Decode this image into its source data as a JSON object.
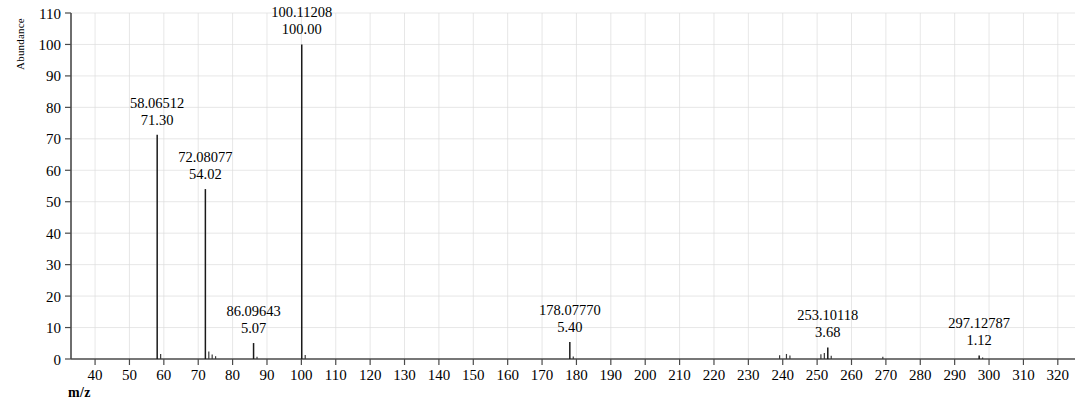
{
  "figure": {
    "y_axis_title": "Abundance",
    "x_axis_title": "m/z",
    "clipped_header": ""
  },
  "chart_data": {
    "type": "bar",
    "title": "",
    "subtitle": "",
    "xlabel": "m/z",
    "ylabel": "Abundance",
    "xlim": [
      33,
      325
    ],
    "ylim": [
      0,
      110
    ],
    "grid": true,
    "legend": null,
    "x_ticks": [
      40,
      50,
      60,
      70,
      80,
      90,
      100,
      110,
      120,
      130,
      140,
      150,
      160,
      170,
      180,
      190,
      200,
      210,
      220,
      230,
      240,
      250,
      260,
      270,
      280,
      290,
      300,
      310,
      320
    ],
    "y_ticks": [
      0,
      10,
      20,
      30,
      40,
      50,
      60,
      70,
      80,
      90,
      100,
      110
    ],
    "labeled_peaks": [
      {
        "mz_label": "58.06512",
        "intensity_label": "71.30",
        "mz": 58.06512,
        "intensity": 71.3
      },
      {
        "mz_label": "72.08077",
        "intensity_label": "54.02",
        "mz": 72.08077,
        "intensity": 54.02
      },
      {
        "mz_label": "86.09643",
        "intensity_label": "5.07",
        "mz": 86.09643,
        "intensity": 5.07
      },
      {
        "mz_label": "100.11208",
        "intensity_label": "100.00",
        "mz": 100.11208,
        "intensity": 100.0
      },
      {
        "mz_label": "178.07770",
        "intensity_label": "5.40",
        "mz": 178.0777,
        "intensity": 5.4
      },
      {
        "mz_label": "253.10118",
        "intensity_label": "3.68",
        "mz": 253.10118,
        "intensity": 3.68
      },
      {
        "mz_label": "297.12787",
        "intensity_label": "1.12",
        "mz": 297.12787,
        "intensity": 1.12
      }
    ],
    "unlabeled_peaks": [
      {
        "mz": 59.07,
        "intensity": 1.6
      },
      {
        "mz": 73.08,
        "intensity": 2.4
      },
      {
        "mz": 74.06,
        "intensity": 1.4
      },
      {
        "mz": 75.05,
        "intensity": 0.9
      },
      {
        "mz": 87.1,
        "intensity": 0.7
      },
      {
        "mz": 101.12,
        "intensity": 1.3
      },
      {
        "mz": 179.08,
        "intensity": 0.8
      },
      {
        "mz": 239.09,
        "intensity": 1.2
      },
      {
        "mz": 241.08,
        "intensity": 1.6
      },
      {
        "mz": 242.09,
        "intensity": 1.1
      },
      {
        "mz": 251.1,
        "intensity": 1.5
      },
      {
        "mz": 252.1,
        "intensity": 1.9
      },
      {
        "mz": 254.1,
        "intensity": 1.0
      },
      {
        "mz": 269.11,
        "intensity": 0.7
      },
      {
        "mz": 298.13,
        "intensity": 0.5
      }
    ]
  }
}
